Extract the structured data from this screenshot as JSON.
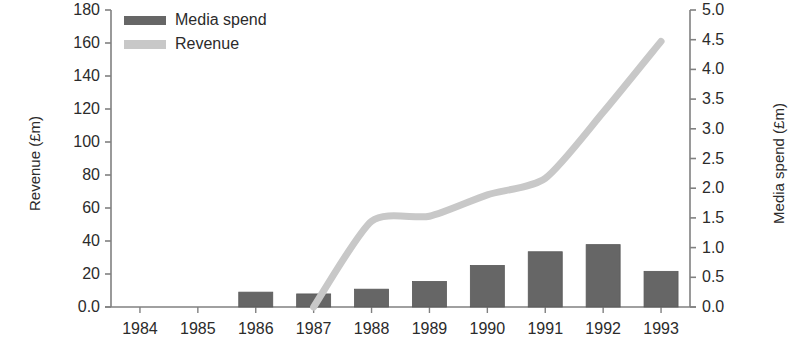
{
  "chart_data": {
    "type": "bar",
    "title": "",
    "xlabel": "",
    "ylabel": "Revenue (£m)",
    "y2label": "Media spend (£m)",
    "grid": false,
    "legend_position": "top-left",
    "categories": [
      "1984",
      "1985",
      "1986",
      "1987",
      "1988",
      "1989",
      "1990",
      "1991",
      "1992",
      "1993"
    ],
    "ylim": [
      0,
      180
    ],
    "y2lim": [
      0,
      5.0
    ],
    "yticks": [
      "0.0",
      "20",
      "40",
      "60",
      "80",
      "100",
      "120",
      "140",
      "160",
      "180"
    ],
    "ytick_values": [
      0,
      20,
      40,
      60,
      80,
      100,
      120,
      140,
      160,
      180
    ],
    "y2ticks": [
      "0.0",
      "0.5",
      "1.0",
      "1.5",
      "2.0",
      "2.5",
      "3.0",
      "3.5",
      "4.0",
      "4.5",
      "5.0"
    ],
    "y2tick_values": [
      0,
      0.5,
      1.0,
      1.5,
      2.0,
      2.5,
      3.0,
      3.5,
      4.0,
      4.5,
      5.0
    ],
    "series": [
      {
        "name": "Media spend",
        "type": "bar",
        "axis": "right",
        "unit": "£m",
        "color": "#666666",
        "values": [
          null,
          null,
          0.25,
          0.22,
          0.3,
          0.43,
          0.7,
          0.93,
          1.05,
          0.6
        ]
      },
      {
        "name": "Revenue",
        "type": "line",
        "axis": "left",
        "unit": "£m",
        "color": "#c8c8c8",
        "values": [
          null,
          null,
          null,
          0,
          52,
          55,
          68,
          78,
          118,
          161
        ]
      }
    ],
    "legend": [
      {
        "label": "Media spend",
        "color": "#666666"
      },
      {
        "label": "Revenue",
        "color": "#c8c8c8"
      }
    ]
  },
  "axes": {
    "left_title": "Revenue (£m)",
    "right_title": "Media spend (£m)"
  },
  "colors": {
    "bar": "#666666",
    "line": "#c8c8c8",
    "axis": "#808080",
    "text": "#2b2b2b"
  }
}
